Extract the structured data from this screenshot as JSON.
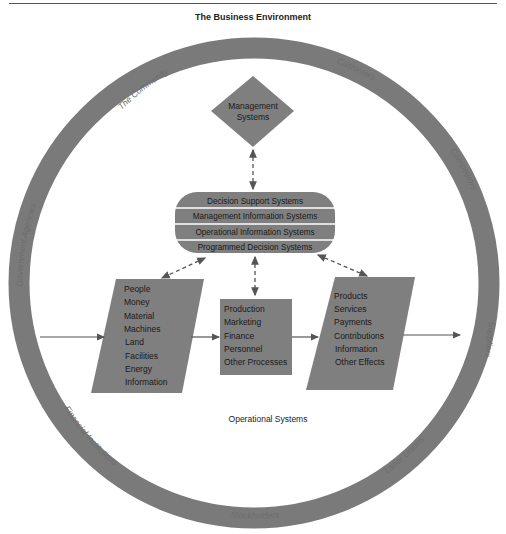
{
  "title": "The Business Environment",
  "colors": {
    "ring": "#7a7a7a",
    "shape_fill": "#7f7f7f",
    "text": "#1a1a1a",
    "arrow": "#555555",
    "background": "#ffffff"
  },
  "ring_labels": [
    {
      "id": "community",
      "label": "The Community"
    },
    {
      "id": "customers",
      "label": "Customers"
    },
    {
      "id": "competitors",
      "label": "Competitors"
    },
    {
      "id": "suppliers",
      "label": "Suppliers"
    },
    {
      "id": "labor-unions",
      "label": "Labor Unions"
    },
    {
      "id": "stockholders",
      "label": "Stockholders"
    },
    {
      "id": "financial-institutions",
      "label": "Financial Institutions"
    },
    {
      "id": "government-agencies",
      "label": "Government Agencies"
    }
  ],
  "management": {
    "line1": "Management",
    "line2": "Systems"
  },
  "information_systems": {
    "bands": [
      "Decision Support Systems",
      "Management Information Systems",
      "Operational Information Systems",
      "Programmed Decision Systems"
    ]
  },
  "inputs": {
    "items": [
      "People",
      "Money",
      "Material",
      "Machines",
      "Land",
      "Facilities",
      "Energy",
      "Information"
    ]
  },
  "processes": {
    "items": [
      "Production",
      "Marketing",
      "Finance",
      "Personnel",
      "Other Processes"
    ]
  },
  "outputs": {
    "items": [
      "Products",
      "Services",
      "Payments",
      "Contributions",
      "Information",
      "Other Effects"
    ]
  },
  "caption": "Operational Systems"
}
